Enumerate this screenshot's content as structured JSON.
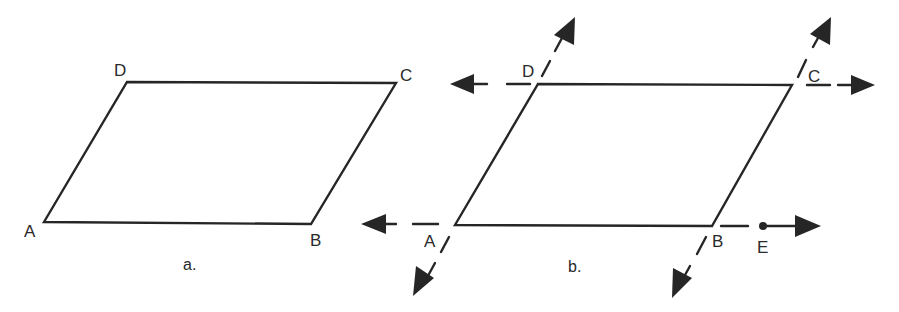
{
  "figures": [
    {
      "id": "a",
      "caption": "a.",
      "shape": "parallelogram",
      "vertices": {
        "A": {
          "label": "A",
          "x": 44,
          "y": 222
        },
        "B": {
          "label": "B",
          "x": 311,
          "y": 224
        },
        "C": {
          "label": "C",
          "x": 396,
          "y": 83
        },
        "D": {
          "label": "D",
          "x": 127,
          "y": 82
        }
      }
    },
    {
      "id": "b",
      "caption": "b.",
      "shape": "parallelogram with sides extended as lines",
      "vertices": {
        "A": {
          "label": "A",
          "x": 455,
          "y": 225
        },
        "B": {
          "label": "B",
          "x": 712,
          "y": 226
        },
        "C": {
          "label": "C",
          "x": 792,
          "y": 85
        },
        "D": {
          "label": "D",
          "x": 538,
          "y": 84
        }
      },
      "extra_points": {
        "E": {
          "label": "E",
          "x": 763,
          "y": 226
        }
      },
      "extended_lines": [
        "line DC",
        "line AB",
        "line AD",
        "line BC"
      ]
    }
  ],
  "colors": {
    "ink": "#262626",
    "background": "#ffffff"
  }
}
